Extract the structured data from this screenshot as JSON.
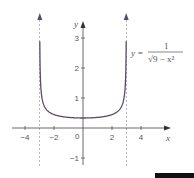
{
  "chart_data": {
    "type": "line",
    "title": "",
    "xlabel": "x",
    "ylabel": "y",
    "xlim": [
      -5,
      5
    ],
    "ylim": [
      -1.5,
      3.6
    ],
    "x_ticks": [
      -4,
      -2,
      2,
      4
    ],
    "x_tick_labels": [
      "−4",
      "−2",
      "2",
      "4"
    ],
    "y_ticks": [
      -1,
      1,
      2,
      3
    ],
    "y_tick_labels": [
      "−1",
      "1",
      "2",
      "3"
    ],
    "origin_label": "0",
    "grid": false,
    "asymptotes": [
      -3,
      3
    ],
    "series": [
      {
        "name": "y = 1/√(9 − x²)",
        "function": "1/sqrt(9 - x^2)",
        "domain": [
          -3,
          3
        ],
        "y_min_at_x0": 0.3333,
        "color": "#5a4a6a"
      }
    ],
    "annotation": {
      "lhs": "y =",
      "numerator": "1",
      "denominator": "√9 − x²",
      "position": "top-right"
    }
  }
}
